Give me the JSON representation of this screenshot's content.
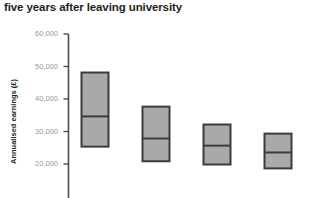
{
  "chart_data": {
    "type": "box",
    "title": "five years after leaving university",
    "xlabel": "",
    "ylabel": "Annualised earnings (£)",
    "ylim": [
      14000,
      60000
    ],
    "yticks": [
      20000,
      30000,
      40000,
      50000,
      60000
    ],
    "ytick_labels": [
      "20,000",
      "30,000",
      "40,000",
      "50,000",
      "60,000"
    ],
    "grid": false,
    "legend": "none",
    "categories": [
      "1",
      "2",
      "3",
      "4"
    ],
    "series": [
      {
        "name": "box-1",
        "upper": 48300,
        "median": 34800,
        "lower": 25500
      },
      {
        "name": "box-2",
        "upper": 37800,
        "median": 28000,
        "lower": 21000
      },
      {
        "name": "box-3",
        "upper": 32300,
        "median": 25800,
        "lower": 20000
      },
      {
        "name": "box-4",
        "upper": 29500,
        "median": 23700,
        "lower": 18800
      }
    ],
    "colors": {
      "box_fill": "#a9a9a9",
      "box_stroke": "#3b3b3b",
      "axis": "#4d4d4d",
      "tick_text": "#9a9a9a",
      "title_text": "#231f20"
    }
  }
}
